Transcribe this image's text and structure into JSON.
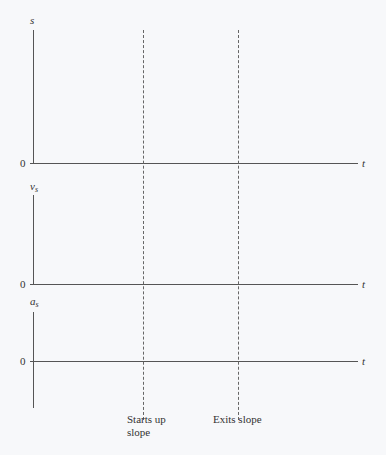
{
  "panels": [
    {
      "ylabel": "s",
      "ylabel_sub": "",
      "zero": "0",
      "xlabel": "t"
    },
    {
      "ylabel": "v",
      "ylabel_sub": "s",
      "zero": "0",
      "xlabel": "t"
    },
    {
      "ylabel": "a",
      "ylabel_sub": "s",
      "zero": "0",
      "xlabel": "t"
    }
  ],
  "markers": [
    {
      "label_line1": "Starts up",
      "label_line2": "slope"
    },
    {
      "label_line1": "Exits slope",
      "label_line2": ""
    }
  ]
}
